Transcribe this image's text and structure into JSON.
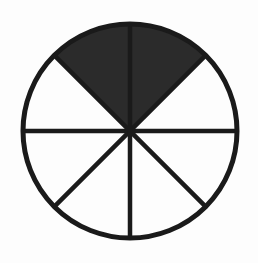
{
  "figure": {
    "name": "fraction-circle-diagram",
    "title": "Circle divided into eight equal sectors with two shaded",
    "background_color": "#fdfdfd",
    "stroke_color": "#1a1a1a",
    "shaded_fill_color": "#2b2b2b",
    "unshaded_fill_color": "#fdfdfd",
    "stroke_width": 4.5,
    "center_x": 130,
    "center_y": 131,
    "radius": 107
  },
  "chart_data": {
    "type": "pie",
    "title": "",
    "subtitle": "",
    "xlabel": "",
    "ylabel": "",
    "grid": false,
    "legend_position": "none",
    "total_slices": 8,
    "slice_angle_degrees": 45,
    "shaded_slices": 2,
    "unshaded_slices": 6,
    "fraction_shaded": "2/8",
    "fraction_shaded_simplified": "1/4",
    "percent_shaded": 25,
    "categories": [
      "sector-1",
      "sector-2",
      "sector-3",
      "sector-4",
      "sector-5",
      "sector-6",
      "sector-7",
      "sector-8"
    ],
    "values": [
      45,
      45,
      45,
      45,
      45,
      45,
      45,
      45
    ],
    "series": [
      {
        "name": "shaded",
        "values": [
          0,
          1,
          1,
          0,
          0,
          0,
          0,
          0
        ]
      }
    ],
    "slices": [
      {
        "id": "sector-1",
        "label": "right-upper sector",
        "start_angle_degrees": 0,
        "end_angle_degrees": 45,
        "shaded": false,
        "fill": "#fdfdfd"
      },
      {
        "id": "sector-2",
        "label": "top-right sector",
        "start_angle_degrees": 45,
        "end_angle_degrees": 90,
        "shaded": true,
        "fill": "#2b2b2b"
      },
      {
        "id": "sector-3",
        "label": "top-left sector",
        "start_angle_degrees": 90,
        "end_angle_degrees": 135,
        "shaded": true,
        "fill": "#2b2b2b"
      },
      {
        "id": "sector-4",
        "label": "left-upper sector",
        "start_angle_degrees": 135,
        "end_angle_degrees": 180,
        "shaded": false,
        "fill": "#fdfdfd"
      },
      {
        "id": "sector-5",
        "label": "left-lower sector",
        "start_angle_degrees": 180,
        "end_angle_degrees": 225,
        "shaded": false,
        "fill": "#fdfdfd"
      },
      {
        "id": "sector-6",
        "label": "bottom-left sector",
        "start_angle_degrees": 225,
        "end_angle_degrees": 270,
        "shaded": false,
        "fill": "#fdfdfd"
      },
      {
        "id": "sector-7",
        "label": "bottom-right sector",
        "start_angle_degrees": 270,
        "end_angle_degrees": 315,
        "shaded": false,
        "fill": "#fdfdfd"
      },
      {
        "id": "sector-8",
        "label": "right-lower sector",
        "start_angle_degrees": 315,
        "end_angle_degrees": 360,
        "shaded": false,
        "fill": "#fdfdfd"
      }
    ],
    "diameters": [
      {
        "id": "horizontal-diameter",
        "angle_degrees": 0
      },
      {
        "id": "diagonal-diameter-45",
        "angle_degrees": 45
      },
      {
        "id": "vertical-diameter",
        "angle_degrees": 90
      },
      {
        "id": "diagonal-diameter-135",
        "angle_degrees": 135
      }
    ],
    "annotations": []
  }
}
